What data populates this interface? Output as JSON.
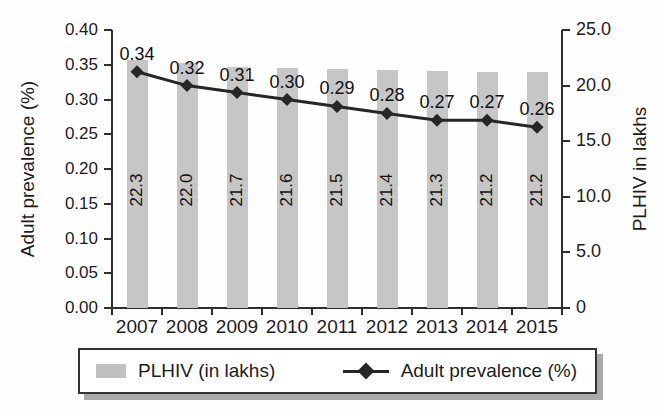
{
  "chart_data": {
    "type": "bar",
    "subtype": "combo-bar-line",
    "categories": [
      "2007",
      "2008",
      "2009",
      "2010",
      "2011",
      "2012",
      "2013",
      "2014",
      "2015"
    ],
    "series": [
      {
        "name": "PLHIV (in lakhs)",
        "chart": "bar",
        "axis": "right",
        "color": "#c6c6c6",
        "values": [
          22.3,
          22.0,
          21.7,
          21.6,
          21.5,
          21.4,
          21.3,
          21.2,
          21.2
        ]
      },
      {
        "name": "Adult prevalence (%)",
        "chart": "line",
        "axis": "left",
        "color": "#262626",
        "marker": "diamond",
        "values": [
          0.34,
          0.32,
          0.31,
          0.3,
          0.29,
          0.28,
          0.27,
          0.27,
          0.26
        ]
      }
    ],
    "bar_value_labels": [
      "22.3",
      "22.0",
      "21.7",
      "21.6",
      "21.5",
      "21.4",
      "21.3",
      "21.2",
      "21.2"
    ],
    "line_value_labels": [
      "0.34",
      "0.32",
      "0.31",
      "0.30",
      "0.29",
      "0.28",
      "0.27",
      "0.27",
      "0.26"
    ],
    "left_axis": {
      "title": "Adult prevalence (%)",
      "min": 0,
      "max": 0.4,
      "tick_labels": [
        "0.00",
        "0.05",
        "0.10",
        "0.15",
        "0.20",
        "0.25",
        "0.30",
        "0.35",
        "0.40"
      ]
    },
    "right_axis": {
      "title": "PLHIV in lakhs",
      "min": 0,
      "max": 25,
      "tick_labels": [
        "0",
        "5.0",
        "10.0",
        "15.0",
        "20.0",
        "25.0"
      ]
    },
    "x_axis": {
      "tick_labels": [
        "2007",
        "2008",
        "2009",
        "2010",
        "2011",
        "2012",
        "2013",
        "2014",
        "2015"
      ]
    },
    "grid": false,
    "legend_position": "bottom"
  },
  "legend": {
    "items": [
      {
        "label": "PLHIV (in lakhs)",
        "marker": "gray-bar-swatch"
      },
      {
        "label": "Adult prevalence (%)",
        "marker": "diamond-line"
      }
    ]
  },
  "colors": {
    "bar": "#c6c6c6",
    "line": "#262626",
    "axis": "#2e2e2e",
    "text": "#1c1c1c",
    "legend_shadow": "#a9a9a9"
  }
}
